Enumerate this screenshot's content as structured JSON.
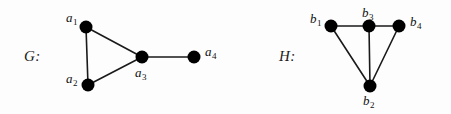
{
  "figure": {
    "width": 451,
    "height": 114,
    "background": "#fdfdfd",
    "ink_color": "#000000",
    "edge_color": "#1a1a1a",
    "node_radius": 6.5,
    "edge_width": 1.6
  },
  "graphs": [
    {
      "id": "G",
      "label": "G:",
      "label_pos": {
        "x": 24,
        "y": 48
      },
      "nodes": [
        {
          "id": "a1",
          "label": "a",
          "sub": "1",
          "x": 86,
          "y": 27,
          "label_pos": {
            "x": 66,
            "y": 11
          }
        },
        {
          "id": "a2",
          "label": "a",
          "sub": "2",
          "x": 88,
          "y": 85,
          "label_pos": {
            "x": 66,
            "y": 72
          }
        },
        {
          "id": "a3",
          "label": "a",
          "sub": "3",
          "x": 142,
          "y": 57,
          "label_pos": {
            "x": 135,
            "y": 66
          }
        },
        {
          "id": "a4",
          "label": "a",
          "sub": "4",
          "x": 194,
          "y": 57,
          "label_pos": {
            "x": 205,
            "y": 45
          }
        }
      ],
      "edges": [
        {
          "from": "a1",
          "to": "a2"
        },
        {
          "from": "a1",
          "to": "a3"
        },
        {
          "from": "a2",
          "to": "a3"
        },
        {
          "from": "a3",
          "to": "a4"
        }
      ]
    },
    {
      "id": "H",
      "label": "H:",
      "label_pos": {
        "x": 279,
        "y": 48
      },
      "nodes": [
        {
          "id": "b1",
          "label": "b",
          "sub": "1",
          "x": 331,
          "y": 26,
          "label_pos": {
            "x": 310,
            "y": 12
          }
        },
        {
          "id": "b3",
          "label": "b",
          "sub": "3",
          "x": 369,
          "y": 26,
          "label_pos": {
            "x": 362,
            "y": 6
          }
        },
        {
          "id": "b4",
          "label": "b",
          "sub": "4",
          "x": 399,
          "y": 26,
          "label_pos": {
            "x": 410,
            "y": 15
          }
        },
        {
          "id": "b2",
          "label": "b",
          "sub": "2",
          "x": 370,
          "y": 86,
          "label_pos": {
            "x": 363,
            "y": 94
          }
        }
      ],
      "edges": [
        {
          "from": "b1",
          "to": "b3"
        },
        {
          "from": "b3",
          "to": "b4"
        },
        {
          "from": "b1",
          "to": "b2"
        },
        {
          "from": "b3",
          "to": "b2"
        },
        {
          "from": "b4",
          "to": "b2"
        }
      ]
    }
  ]
}
